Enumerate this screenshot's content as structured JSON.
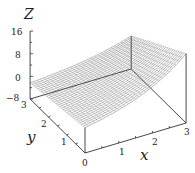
{
  "chart_data": {
    "type": "surface3d",
    "title": "",
    "xlabel": "x",
    "ylabel": "y",
    "zlabel": "Z",
    "x_ticks": [
      "0",
      "1",
      "2",
      "3"
    ],
    "y_ticks": [
      "0",
      "1",
      "2",
      "3"
    ],
    "z_ticks": [
      "−8",
      "0",
      "8",
      "16"
    ],
    "xlim": [
      0,
      3
    ],
    "ylim": [
      0,
      3
    ],
    "zlim": [
      -8,
      16
    ],
    "grid": false,
    "legend": null,
    "surface_corners": {
      "x0_y0": 1,
      "x3_y0": 16.5,
      "x0_y3": -2.3,
      "x3_y3": 3.7
    },
    "mesh": {
      "nx": 30,
      "ny": 30,
      "style": "wireframe",
      "color": "#555555"
    }
  }
}
